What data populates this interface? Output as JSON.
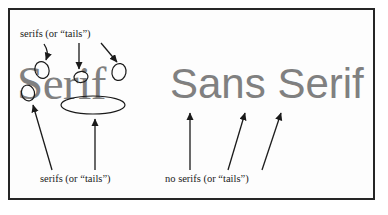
{
  "figure": {
    "background_color": "#ffffff",
    "border_color": "#262626",
    "specimen_color": "#808080",
    "annotation_color": "#1a1a1a"
  },
  "specimens": {
    "serif": {
      "text": "Serif",
      "style_name": "serif-typeface-specimen"
    },
    "sans_serif": {
      "text": "Sans Serif",
      "style_name": "sans-serif-typeface-specimen"
    }
  },
  "labels": {
    "top": "serifs (or “tails”)",
    "bottom_left": "serifs (or “tails”)",
    "bottom_right": "no serifs (or “tails”)"
  }
}
